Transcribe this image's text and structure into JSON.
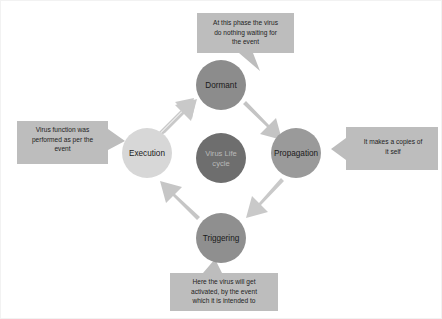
{
  "diagram": {
    "title": "Virus Life cycle",
    "center": {
      "name": "center-node",
      "line1": "Virus Life",
      "line2": "cycle",
      "fill": "#6e6e6e",
      "text_color": "#b9b9b9"
    },
    "nodes": [
      {
        "id": "dormant",
        "label": "Dormant",
        "fill": "#8c8c8c",
        "cx": 220,
        "cy": 84,
        "r": 25
      },
      {
        "id": "propagation",
        "label": "Propagation",
        "fill": "#9a9a9a",
        "cx": 295,
        "cy": 152,
        "r": 25
      },
      {
        "id": "triggering",
        "label": "Triggering",
        "fill": "#8f8f8f",
        "cx": 220,
        "cy": 237,
        "r": 25
      },
      {
        "id": "execution",
        "label": "Execution",
        "fill": "#d7d7d7",
        "cx": 146,
        "cy": 152,
        "r": 25
      }
    ],
    "arrows": [
      {
        "id": "arrow-execution-to-dormant",
        "from": "execution",
        "to": "dormant",
        "direction": "up-right",
        "fill": "#c9c9c9"
      },
      {
        "id": "arrow-dormant-to-propagation",
        "from": "dormant",
        "to": "propagation",
        "direction": "down-right",
        "fill": "#c4c4c4"
      },
      {
        "id": "arrow-propagation-to-triggering",
        "from": "propagation",
        "to": "triggering",
        "direction": "down-left",
        "fill": "#c9c9c9"
      },
      {
        "id": "arrow-triggering-to-execution",
        "from": "triggering",
        "to": "execution",
        "direction": "up-left",
        "fill": "#c6c6c6"
      }
    ],
    "callouts": [
      {
        "id": "callout-dormant",
        "target": "dormant",
        "position": "top",
        "fill": "#bdbdbd",
        "lines": [
          "At this phase the virus",
          "do nothing waiting for",
          "the event"
        ]
      },
      {
        "id": "callout-propagation",
        "target": "propagation",
        "position": "right",
        "fill": "#bdbdbd",
        "lines": [
          "It makes a copies of",
          "it self"
        ]
      },
      {
        "id": "callout-triggering",
        "target": "triggering",
        "position": "bottom",
        "fill": "#bdbdbd",
        "lines": [
          "Here the virus will get",
          "activated, by the event",
          "which it is intended to"
        ]
      },
      {
        "id": "callout-execution",
        "target": "execution",
        "position": "left",
        "fill": "#bdbdbd",
        "lines": [
          "Virus function was",
          "performed as per the",
          "event"
        ]
      }
    ]
  }
}
